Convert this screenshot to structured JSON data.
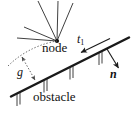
{
  "figure": {
    "background_color": "#ffffff",
    "line_color": "#1a1a1a",
    "width": 135,
    "height": 119
  },
  "labels": {
    "node": "node",
    "obstacle": "obstacle",
    "tangent": "t",
    "tangent_subscript": "1",
    "normal": "n",
    "gap": "g"
  },
  "diagram_data": {
    "type": "diagram",
    "node_point": [
      57,
      41
    ],
    "rays_from_node": [
      [
        38,
        1
      ],
      [
        57,
        1
      ],
      [
        73,
        3
      ],
      [
        24,
        27
      ],
      [
        18,
        38
      ]
    ],
    "obstacle_line": {
      "start": [
        12,
        96
      ],
      "end": [
        128,
        38
      ],
      "stroke_width": 2.4
    },
    "hatch_marks": [
      [
        18,
        94
      ],
      [
        44,
        81
      ],
      [
        70,
        68
      ],
      [
        99,
        53
      ]
    ],
    "tangent_arrow": {
      "from": [
        108,
        39
      ],
      "to": [
        81,
        52
      ],
      "direction": "down-left along obstacle"
    },
    "normal_arrow": {
      "from": [
        108,
        49
      ],
      "to": [
        119,
        69
      ],
      "direction": "down-right perpendicular to obstacle"
    },
    "gap_arc": {
      "from": [
        57,
        41
      ],
      "to": [
        8,
        66
      ],
      "style": "dotted"
    },
    "gap_arrow": {
      "from": [
        21,
        58
      ],
      "to": [
        35,
        81
      ],
      "style": "dotted double-headed"
    }
  }
}
